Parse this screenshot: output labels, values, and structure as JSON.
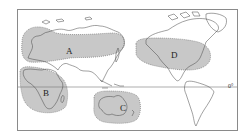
{
  "map": {
    "projection": "Pacific-centered world map",
    "regions": [
      {
        "id": "A",
        "label": "A",
        "area": "Europe and northern Asia"
      },
      {
        "id": "B",
        "label": "B",
        "area": "Africa"
      },
      {
        "id": "C",
        "label": "C",
        "area": "Australia"
      },
      {
        "id": "D",
        "label": "D",
        "area": "North America"
      }
    ],
    "equator": {
      "label": "0°"
    },
    "colors": {
      "region_fill": "#c8c8c8",
      "region_border": "#6a6a6a",
      "coastline": "#444444",
      "frame": "#8a8a8a"
    }
  }
}
